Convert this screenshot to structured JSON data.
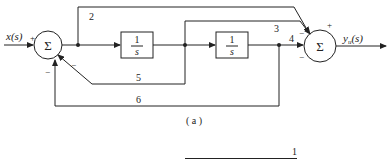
{
  "diagram": {
    "type": "block-diagram",
    "input_label": "x(s)",
    "output_label": "y",
    "output_sub": "u",
    "output_tail": "(s)",
    "summer1": {
      "symbol": "Σ",
      "sign_input": "+",
      "sign_bottom": "−",
      "sign_diag": "−"
    },
    "summer2": {
      "symbol": "Σ",
      "sign_top": "+",
      "sign_upper_left": "−",
      "sign_left": "−"
    },
    "block1": {
      "num": "1",
      "den": "s"
    },
    "block2": {
      "num": "1",
      "den": "s"
    },
    "path_labels": {
      "p2": "2",
      "p3": "3",
      "p4": "4",
      "p5": "5",
      "p6": "6"
    },
    "caption": "( a )",
    "partial_fraction_num": "1"
  }
}
